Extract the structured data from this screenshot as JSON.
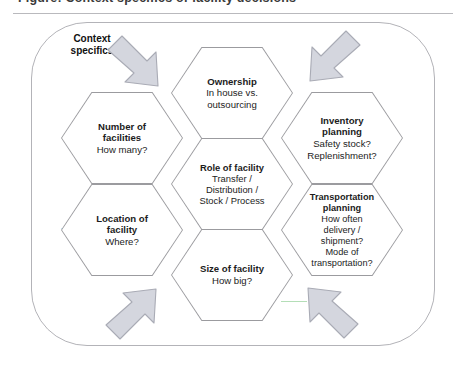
{
  "caption": {
    "text": "Figure: Context specifics of facility decisions"
  },
  "colors": {
    "hex_border": "#9b9b9f",
    "frame_border": "#b3b3b8",
    "arrow_fill": "#d4d6de",
    "arrow_stroke": "#a9abb5",
    "text": "#1c1c1c"
  },
  "diagram": {
    "context_label": "Context\nspecifics",
    "context_label_line1": "Context",
    "context_label_line2": "specifics",
    "arrows": [
      {
        "name": "arrow-top-left",
        "direction": "down-right"
      },
      {
        "name": "arrow-top-right",
        "direction": "down-left"
      },
      {
        "name": "arrow-bottom-left",
        "direction": "up-right"
      },
      {
        "name": "arrow-bottom-right",
        "direction": "up-left"
      }
    ],
    "hexagons": [
      {
        "id": "ownership",
        "title": "Ownership",
        "subtitle": "In house vs.\noutsourcing",
        "sub_lines": [
          "In house vs.",
          "outsourcing"
        ]
      },
      {
        "id": "number-of-facilities",
        "title": "Number of\nfacilities",
        "title_lines": [
          "Number of",
          "facilities"
        ],
        "subtitle": "How many?",
        "sub_lines": [
          "How many?"
        ]
      },
      {
        "id": "inventory-planning",
        "title": "Inventory\nplanning",
        "title_lines": [
          "Inventory",
          "planning"
        ],
        "subtitle": "Safety stock?\nReplenishment?",
        "sub_lines": [
          "Safety stock?",
          "Replenishment?"
        ]
      },
      {
        "id": "role-of-facility",
        "title": "Role of facility",
        "title_lines": [
          "Role of facility"
        ],
        "subtitle": "Transfer /\nDistribution /\nStock / Process",
        "sub_lines": [
          "Transfer /",
          "Distribution /",
          "Stock / Process"
        ]
      },
      {
        "id": "location-of-facility",
        "title": "Location of\nfacility",
        "title_lines": [
          "Location of",
          "facility"
        ],
        "subtitle": "Where?",
        "sub_lines": [
          "Where?"
        ]
      },
      {
        "id": "transportation-planning",
        "title": "Transportation\nplanning",
        "title_lines": [
          "Transportation",
          "planning"
        ],
        "subtitle": "How often\ndelivery /\nshipment?\nMode of\ntransportation?",
        "sub_lines": [
          "How often",
          "delivery /",
          "shipment?",
          "Mode of",
          "transportation?"
        ]
      },
      {
        "id": "size-of-facility",
        "title": "Size of facility",
        "title_lines": [
          "Size of facility"
        ],
        "subtitle": "How big?",
        "sub_lines": [
          "How big?"
        ]
      }
    ]
  }
}
